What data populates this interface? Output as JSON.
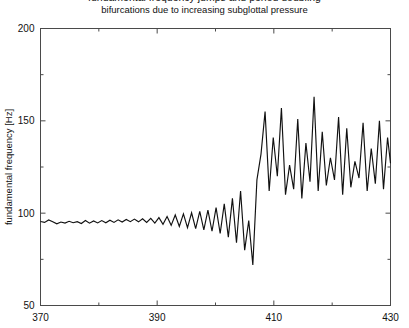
{
  "chart_data": {
    "type": "line",
    "title": "bifurcations due to increasing subglottal pressure",
    "title_cut_off_above": "fundamental frequency jumps and period doubling",
    "xlabel": "",
    "ylabel": "fundamental frequency [Hz]",
    "xlim": [
      370,
      430
    ],
    "ylim": [
      50,
      200
    ],
    "xticks": [
      370,
      390,
      410,
      430
    ],
    "xtick_labels": [
      "370",
      "390",
      "410",
      "430"
    ],
    "xminor_step": 10,
    "yticks": [
      50,
      100,
      150,
      200
    ],
    "ytick_labels": [
      "50",
      "100",
      "150",
      "200"
    ],
    "yminor_step": 25,
    "grid": false,
    "legend": null,
    "series": [
      {
        "name": "fundamental frequency",
        "color": "#111111",
        "x": [
          370.0,
          370.7,
          371.4,
          372.1,
          372.8,
          373.5,
          374.2,
          374.9,
          375.6,
          376.3,
          377.0,
          377.7,
          378.4,
          379.1,
          379.8,
          380.5,
          381.2,
          381.9,
          382.6,
          383.3,
          384.0,
          384.7,
          385.4,
          386.1,
          386.8,
          387.5,
          388.2,
          388.9,
          389.6,
          390.3,
          391.0,
          391.7,
          392.4,
          393.1,
          393.8,
          394.5,
          395.2,
          395.9,
          396.6,
          397.3,
          398.0,
          398.7,
          399.4,
          400.1,
          400.8,
          401.5,
          402.2,
          402.9,
          403.6,
          404.3,
          405.0,
          405.7,
          406.4,
          407.1,
          407.8,
          408.5,
          409.2,
          409.9,
          410.6,
          411.3,
          412.0,
          412.7,
          413.4,
          414.1,
          414.8,
          415.5,
          416.2,
          416.9,
          417.6,
          418.3,
          419.0,
          419.7,
          420.4,
          421.1,
          421.8,
          422.5,
          423.2,
          423.9,
          424.6,
          425.3,
          426.0,
          426.7,
          427.4,
          428.1,
          428.8,
          429.5,
          430.0
        ],
        "y": [
          95.5,
          95.0,
          96.3,
          95.4,
          94.2,
          95.2,
          94.6,
          95.6,
          94.8,
          95.4,
          94.4,
          96.0,
          94.6,
          95.8,
          94.7,
          96.0,
          94.8,
          96.2,
          95.0,
          96.4,
          95.2,
          96.6,
          95.4,
          96.8,
          95.3,
          97.0,
          95.0,
          97.2,
          94.6,
          97.6,
          94.0,
          98.2,
          93.4,
          99.0,
          92.8,
          99.6,
          92.2,
          100.2,
          91.6,
          101.0,
          91.0,
          101.6,
          90.2,
          103.0,
          89.0,
          105.0,
          87.0,
          108.0,
          84.0,
          112.0,
          80.0,
          96.0,
          72.0,
          118.0,
          132.0,
          155.0,
          112.0,
          141.0,
          120.0,
          157.0,
          110.0,
          126.0,
          113.0,
          151.0,
          108.0,
          138.0,
          117.0,
          163.0,
          112.0,
          144.0,
          115.0,
          130.0,
          118.0,
          152.0,
          110.0,
          146.0,
          114.0,
          128.0,
          119.0,
          149.0,
          112.0,
          135.0,
          116.0,
          150.0,
          113.0,
          141.0,
          127.0
        ]
      }
    ],
    "annotations": {
      "regime_1": "near-constant fundamental frequency around 95 Hz",
      "regime_2": "growing period-2 oscillation before the bifurcation",
      "regime_3": "deep minimum near 405 (about 72 Hz) then jump to a higher chaotic regime oscillating between about 108 and 163 Hz"
    }
  }
}
